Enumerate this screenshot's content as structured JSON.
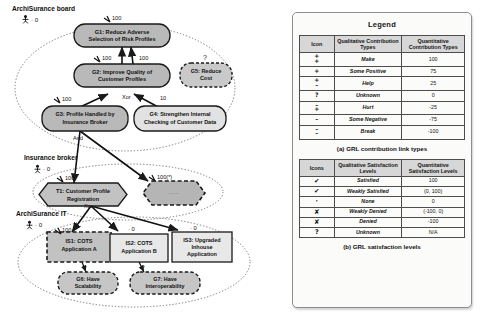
{
  "diagram": {
    "actors": [
      {
        "name": "ArchiSurance board",
        "satisfaction": "0",
        "icon": "actor-icon"
      },
      {
        "name": "Insurance broker",
        "satisfaction": "0",
        "icon": "actor-icon"
      },
      {
        "name": "ArchiSurance IT",
        "satisfaction": "0",
        "icon": "actor-icon"
      }
    ],
    "nodes": [
      {
        "id": "G1",
        "label": "G1: Reduce Adverse Selection of Risk Profiles",
        "shape": "softgoal",
        "style": "solid",
        "fill": "#b9b9b9",
        "mark": "100"
      },
      {
        "id": "G2",
        "label": "G2: Improve Quality of Customer Profiles",
        "shape": "softgoal",
        "style": "solid",
        "fill": "#b9b9b9",
        "mark": "100"
      },
      {
        "id": "G5",
        "label": "G5: Reduce Cost",
        "shape": "softgoal",
        "style": "dashed",
        "fill": "#c9c9c9",
        "mark": "?"
      },
      {
        "id": "G3",
        "label": "G3: Profile Handled by Insurance Broker",
        "shape": "softgoal",
        "style": "solid",
        "fill": "#b9b9b9",
        "mark": "100"
      },
      {
        "id": "G4",
        "label": "G4: Strengthen Internal Checking of Customer Data",
        "shape": "softgoal",
        "style": "solid",
        "fill": "#e2e2e2",
        "mark": "0"
      },
      {
        "id": "T1",
        "label": "T1: Customer Profile Registration",
        "shape": "task",
        "style": "solid",
        "fill": "#c2c2c2",
        "mark": "100"
      },
      {
        "id": "T2",
        "label": "",
        "shape": "task",
        "style": "dashed",
        "fill": "#b5b5b5",
        "mark": "100(*)"
      },
      {
        "id": "IS1",
        "label": "IS1: COTS Application A",
        "shape": "resource",
        "style": "dashed",
        "fill": "#c2c2c2",
        "mark": "100"
      },
      {
        "id": "IS2",
        "label": "IS2: COTS Application B",
        "shape": "resource",
        "style": "solid",
        "fill": "#e8e8e8",
        "mark": "0"
      },
      {
        "id": "IS3",
        "label": "IS3: Upgraded Inhouse Application",
        "shape": "resource",
        "style": "solid",
        "fill": "#e8e8e8",
        "mark": "0"
      },
      {
        "id": "G6",
        "label": "G6: Have Scalability",
        "shape": "softgoal",
        "style": "dashed",
        "fill": "#c6c6c6",
        "mark": "?"
      },
      {
        "id": "G7",
        "label": "G7: Have Interoperability",
        "shape": "softgoal",
        "style": "dashed",
        "fill": "#c6c6c6",
        "mark": "?"
      }
    ],
    "link_labels": [
      "And",
      "Xor",
      "Xor"
    ],
    "contribution_values": [
      "100",
      "100",
      "100",
      "100",
      "10",
      "100",
      "100(*)",
      "100"
    ]
  },
  "legend": {
    "title": "Legend",
    "contribution": {
      "caption": "(a) GRL contribution link types",
      "headers": [
        "Icon",
        "Qualitative Contribution Types",
        "Quantitative Contribution Types"
      ],
      "rows": [
        {
          "icon": "make-icon",
          "glyph_top": "+",
          "glyph_bottom": "+",
          "qualitative": "Make",
          "quantitative": "100"
        },
        {
          "icon": "some-positive-icon",
          "glyph_top": "+",
          "glyph_bottom": "",
          "qualitative": "Some Positive",
          "quantitative": "75"
        },
        {
          "icon": "help-icon",
          "glyph_top": "+",
          "glyph_bottom": "–",
          "qualitative": "Help",
          "quantitative": "25"
        },
        {
          "icon": "unknown-icon",
          "glyph_top": "?",
          "glyph_bottom": "",
          "qualitative": "Unknown",
          "quantitative": "0"
        },
        {
          "icon": "hurt-icon",
          "glyph_top": "–",
          "glyph_bottom": "+",
          "qualitative": "Hurt",
          "quantitative": "-25"
        },
        {
          "icon": "some-negative-icon",
          "glyph_top": "–",
          "glyph_bottom": "",
          "qualitative": "Some Negative",
          "quantitative": "-75"
        },
        {
          "icon": "break-icon",
          "glyph_top": "–",
          "glyph_bottom": "–",
          "qualitative": "Break",
          "quantitative": "-100"
        }
      ]
    },
    "satisfaction": {
      "caption": "(b) GRL satisfaction levels",
      "headers": [
        "Icons",
        "Qualitative Satisfaction Levels",
        "Quantitative Satisfaction Levels"
      ],
      "rows": [
        {
          "icon": "satisfied-check-icon",
          "glyph": "✔",
          "qualitative": "Satisfied",
          "quantitative": "100"
        },
        {
          "icon": "weakly-satisfied-check-icon",
          "glyph": "✔",
          "qualitative": "Weakly Satisfied",
          "quantitative": "(0, 100)"
        },
        {
          "icon": "none-dot-icon",
          "glyph": "·",
          "qualitative": "None",
          "quantitative": "0"
        },
        {
          "icon": "weakly-denied-icon",
          "glyph": "✘",
          "qualitative": "Weakly Denied",
          "quantitative": "(-100, 0)"
        },
        {
          "icon": "denied-icon",
          "glyph": "✘",
          "qualitative": "Denied",
          "quantitative": "-100"
        },
        {
          "icon": "unknown-question-icon",
          "glyph": "?",
          "qualitative": "Unknown",
          "quantitative": "N/A"
        }
      ]
    }
  }
}
